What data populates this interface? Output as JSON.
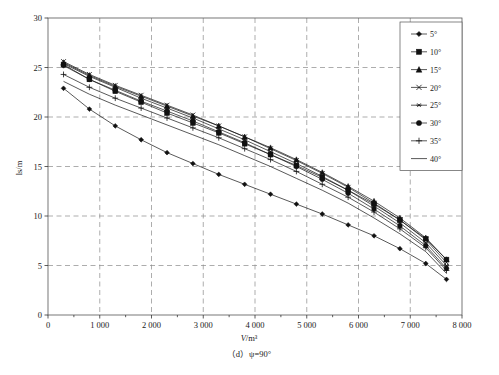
{
  "figure": {
    "caption": "（d）ψ=90°",
    "caption_prefix": "（d）",
    "caption_symbol": "ψ=90°"
  },
  "chart_data": {
    "type": "line",
    "title": "",
    "subtitle": "",
    "xlabel": "V/m³",
    "xlabel_italic": "V",
    "xlabel_rest": "/m³",
    "ylabel": "ls/m",
    "xlim": [
      0,
      8000
    ],
    "ylim": [
      0,
      30
    ],
    "xticks": [
      0,
      1000,
      2000,
      3000,
      4000,
      5000,
      6000,
      7000,
      8000
    ],
    "xtick_labels": [
      "0",
      "1 000",
      "2 000",
      "3 000",
      "4 000",
      "5 000",
      "6 000",
      "7 000",
      "8 000"
    ],
    "yticks": [
      0,
      5,
      10,
      15,
      20,
      25,
      30
    ],
    "ytick_labels": [
      "0",
      "5",
      "10",
      "15",
      "20",
      "25",
      "30"
    ],
    "grid": true,
    "grid_style": "dashed",
    "legend_position": "top-right",
    "x": [
      300,
      800,
      1300,
      1800,
      2300,
      2800,
      3300,
      3800,
      4300,
      4800,
      5300,
      5800,
      6300,
      6800,
      7300,
      7700
    ],
    "series": [
      {
        "name": "5°",
        "label": "5°",
        "marker": "diamond",
        "values": [
          22.9,
          20.8,
          19.1,
          17.7,
          16.4,
          15.3,
          14.2,
          13.2,
          12.2,
          11.2,
          10.2,
          9.1,
          8.0,
          6.7,
          5.2,
          3.6
        ]
      },
      {
        "name": "10°",
        "label": "10°",
        "marker": "square",
        "values": [
          25.3,
          23.8,
          22.6,
          21.5,
          20.4,
          19.4,
          18.4,
          17.3,
          16.2,
          15.1,
          13.9,
          12.6,
          11.2,
          9.6,
          7.7,
          5.6
        ]
      },
      {
        "name": "15°",
        "label": "15°",
        "marker": "triangle",
        "values": [
          25.5,
          24.2,
          23.1,
          22.1,
          21.1,
          20.1,
          19.1,
          18.0,
          16.9,
          15.7,
          14.4,
          13.0,
          11.5,
          9.8,
          7.8,
          5.6
        ]
      },
      {
        "name": "20°",
        "label": "20°",
        "marker": "cross-x",
        "values": [
          25.6,
          24.3,
          23.2,
          22.2,
          21.2,
          20.2,
          19.1,
          18.0,
          16.8,
          15.6,
          14.3,
          12.9,
          11.3,
          9.6,
          7.6,
          5.3
        ]
      },
      {
        "name": "25°",
        "label": "25°",
        "marker": "asterisk",
        "values": [
          25.4,
          24.1,
          23.0,
          21.9,
          20.9,
          19.9,
          18.8,
          17.7,
          16.5,
          15.3,
          14.0,
          12.6,
          11.0,
          9.3,
          7.3,
          5.0
        ]
      },
      {
        "name": "30°",
        "label": "30°",
        "marker": "circle",
        "values": [
          25.2,
          23.8,
          22.7,
          21.6,
          20.6,
          19.6,
          18.5,
          17.4,
          16.2,
          15.0,
          13.7,
          12.3,
          10.7,
          9.0,
          7.0,
          4.7
        ]
      },
      {
        "name": "35°",
        "label": "35°",
        "marker": "plus",
        "values": [
          24.3,
          23.0,
          21.9,
          20.9,
          19.9,
          18.9,
          17.9,
          16.8,
          15.7,
          14.5,
          13.2,
          11.9,
          10.4,
          8.7,
          6.8,
          4.5
        ]
      },
      {
        "name": "40°",
        "label": "40°",
        "marker": "none",
        "values": [
          23.6,
          22.3,
          21.2,
          20.2,
          19.2,
          18.2,
          17.2,
          16.1,
          15.0,
          13.8,
          12.6,
          11.3,
          9.8,
          8.2,
          6.4,
          4.2
        ]
      }
    ]
  }
}
